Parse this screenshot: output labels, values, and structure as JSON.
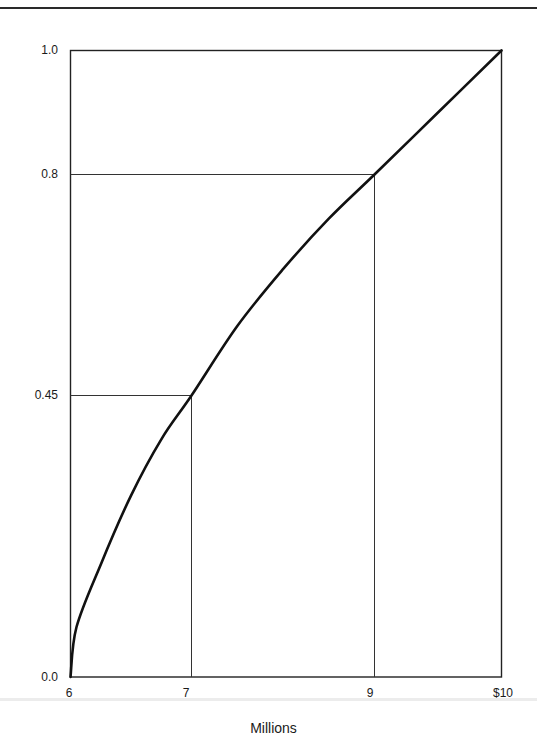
{
  "chart_data": {
    "type": "line",
    "title": "",
    "xlabel": "Millions",
    "ylabel": "",
    "xlim": [
      6,
      10
    ],
    "ylim": [
      0,
      1
    ],
    "grid": false,
    "legend": null,
    "x_ticks": [
      "6",
      "7",
      "9",
      "$10"
    ],
    "y_ticks": [
      "0.0",
      "0.45",
      "0.8",
      "1.0"
    ],
    "series": [
      {
        "name": "utility curve",
        "x": [
          6,
          6.05,
          6.25,
          6.5,
          6.75,
          7,
          7.5,
          8,
          8.5,
          9,
          9.5,
          10
        ],
        "values": [
          0,
          0.08,
          0.18,
          0.29,
          0.38,
          0.45,
          0.56,
          0.65,
          0.73,
          0.8,
          0.9,
          1.0
        ]
      }
    ],
    "reference_lines": [
      {
        "x": 7,
        "y": 0.45
      },
      {
        "x": 9,
        "y": 0.8
      }
    ]
  },
  "labels": {
    "y0": "0.0",
    "y045": "0.45",
    "y08": "0.8",
    "y1": "1.0",
    "x6": "6",
    "x7": "7",
    "x9": "9",
    "x10": "$10",
    "xaxis": "Millions"
  }
}
